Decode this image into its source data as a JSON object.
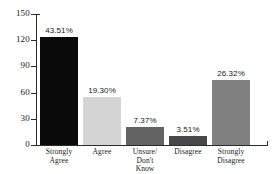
{
  "chart_data": {
    "type": "bar",
    "title": "",
    "subtitle": "",
    "xlabel": "",
    "ylabel": "",
    "ylim": [
      0,
      150
    ],
    "ytick_values": [
      0,
      30,
      60,
      90,
      120,
      150
    ],
    "ytick_labels": [
      "0",
      "30",
      "60",
      "90",
      "120",
      "150"
    ],
    "grid": false,
    "legend": false,
    "categories": [
      "Strongly\nAgree",
      "Agree",
      "Unsure/\nDon't\nKnow",
      "Disagree",
      "Strongly\nDisagree"
    ],
    "values": [
      124,
      55,
      21,
      10,
      75
    ],
    "data_labels": [
      "43.51%",
      "19.30%",
      "7.37%",
      "3.51%",
      "26.32%"
    ],
    "bar_colors": [
      "#0a0a0a",
      "#d4d4d4",
      "#636363",
      "#474747",
      "#808080"
    ]
  },
  "axis": {
    "line_color": "#2b2b2b",
    "background": "#ffffff"
  }
}
